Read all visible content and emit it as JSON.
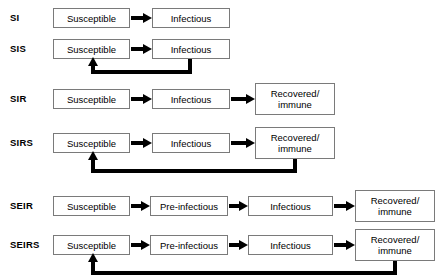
{
  "diagram": {
    "width": 443,
    "height": 280,
    "stroke_color": "#000000",
    "box_border_color": "#7a7a7a",
    "background_color": "#ffffff"
  },
  "labels": {
    "susceptible": "Susceptible",
    "infectious": "Infectious",
    "pre_infectious": "Pre-infectious",
    "recovered": "Recovered/\nimmune"
  },
  "rows": [
    {
      "id": "si",
      "name": "SI",
      "y": 18,
      "boxes": [
        {
          "name": "susceptible",
          "label": "Susceptible",
          "x": 53,
          "y": 8,
          "w": 77,
          "h": 20
        },
        {
          "name": "infectious",
          "label": "Infectious",
          "x": 152,
          "y": 8,
          "w": 78,
          "h": 20
        }
      ],
      "arrows": [
        {
          "from": "susceptible",
          "to": "infectious",
          "x": 131,
          "y": 18,
          "len": 21
        }
      ],
      "loop": null
    },
    {
      "id": "sis",
      "name": "SIS",
      "y": 49,
      "boxes": [
        {
          "name": "susceptible",
          "label": "Susceptible",
          "x": 53,
          "y": 39,
          "w": 77,
          "h": 20
        },
        {
          "name": "infectious",
          "label": "Infectious",
          "x": 152,
          "y": 39,
          "w": 78,
          "h": 20
        }
      ],
      "arrows": [
        {
          "from": "susceptible",
          "to": "infectious",
          "x": 131,
          "y": 49,
          "len": 21
        }
      ],
      "loop": {
        "from": "infectious",
        "to": "susceptible",
        "source_x": 190,
        "source_y": 59,
        "bottom_y": 70,
        "target_x": 93,
        "target_y": 60
      }
    },
    {
      "id": "sir",
      "name": "SIR",
      "y": 99,
      "boxes": [
        {
          "name": "susceptible",
          "label": "Susceptible",
          "x": 53,
          "y": 89,
          "w": 77,
          "h": 20
        },
        {
          "name": "infectious",
          "label": "Infectious",
          "x": 152,
          "y": 89,
          "w": 78,
          "h": 20
        },
        {
          "name": "recovered",
          "label": "Recovered/\nimmune",
          "x": 255,
          "y": 83,
          "w": 80,
          "h": 32
        }
      ],
      "arrows": [
        {
          "from": "susceptible",
          "to": "infectious",
          "x": 131,
          "y": 99,
          "len": 21
        },
        {
          "from": "infectious",
          "to": "recovered",
          "x": 231,
          "y": 99,
          "len": 24
        }
      ],
      "loop": null
    },
    {
      "id": "sirs",
      "name": "SIRS",
      "y": 143,
      "boxes": [
        {
          "name": "susceptible",
          "label": "Susceptible",
          "x": 53,
          "y": 133,
          "w": 77,
          "h": 20
        },
        {
          "name": "infectious",
          "label": "Infectious",
          "x": 152,
          "y": 133,
          "w": 78,
          "h": 20
        },
        {
          "name": "recovered",
          "label": "Recovered/\nimmune",
          "x": 255,
          "y": 127,
          "w": 80,
          "h": 32
        }
      ],
      "arrows": [
        {
          "from": "susceptible",
          "to": "infectious",
          "x": 131,
          "y": 143,
          "len": 21
        },
        {
          "from": "infectious",
          "to": "recovered",
          "x": 231,
          "y": 143,
          "len": 24
        }
      ],
      "loop": {
        "from": "recovered",
        "to": "susceptible",
        "source_x": 295,
        "source_y": 159,
        "bottom_y": 169,
        "target_x": 93,
        "target_y": 154
      }
    },
    {
      "id": "seir",
      "name": "SEIR",
      "y": 206,
      "boxes": [
        {
          "name": "susceptible",
          "label": "Susceptible",
          "x": 53,
          "y": 196,
          "w": 77,
          "h": 20
        },
        {
          "name": "pre-infectious",
          "label": "Pre-infectious",
          "x": 150,
          "y": 196,
          "w": 78,
          "h": 20
        },
        {
          "name": "infectious",
          "label": "Infectious",
          "x": 248,
          "y": 196,
          "w": 85,
          "h": 20
        },
        {
          "name": "recovered",
          "label": "Recovered/\nimmune",
          "x": 355,
          "y": 190,
          "w": 80,
          "h": 32
        }
      ],
      "arrows": [
        {
          "from": "susceptible",
          "to": "pre-infectious",
          "x": 131,
          "y": 206,
          "len": 19
        },
        {
          "from": "pre-infectious",
          "to": "infectious",
          "x": 229,
          "y": 206,
          "len": 19
        },
        {
          "from": "infectious",
          "to": "recovered",
          "x": 334,
          "y": 206,
          "len": 21
        }
      ],
      "loop": null
    },
    {
      "id": "seirs",
      "name": "SEIRS",
      "y": 245,
      "boxes": [
        {
          "name": "susceptible",
          "label": "Susceptible",
          "x": 53,
          "y": 235,
          "w": 77,
          "h": 20
        },
        {
          "name": "pre-infectious",
          "label": "Pre-infectious",
          "x": 150,
          "y": 235,
          "w": 78,
          "h": 20
        },
        {
          "name": "infectious",
          "label": "Infectious",
          "x": 248,
          "y": 235,
          "w": 85,
          "h": 20
        },
        {
          "name": "recovered",
          "label": "Recovered/\nimmune",
          "x": 355,
          "y": 229,
          "w": 80,
          "h": 32
        }
      ],
      "arrows": [
        {
          "from": "susceptible",
          "to": "pre-infectious",
          "x": 131,
          "y": 245,
          "len": 19
        },
        {
          "from": "pre-infectious",
          "to": "infectious",
          "x": 229,
          "y": 245,
          "len": 19
        },
        {
          "from": "infectious",
          "to": "recovered",
          "x": 334,
          "y": 245,
          "len": 21
        }
      ],
      "loop": {
        "from": "recovered",
        "to": "susceptible",
        "source_x": 395,
        "source_y": 261,
        "bottom_y": 271,
        "target_x": 93,
        "target_y": 256
      }
    }
  ],
  "row_label_positions": [
    {
      "id": "si",
      "x": 10,
      "y": 13
    },
    {
      "id": "sis",
      "x": 10,
      "y": 44
    },
    {
      "id": "sir",
      "x": 10,
      "y": 94
    },
    {
      "id": "sirs",
      "x": 10,
      "y": 138
    },
    {
      "id": "seir",
      "x": 10,
      "y": 201
    },
    {
      "id": "seirs",
      "x": 10,
      "y": 240
    }
  ]
}
